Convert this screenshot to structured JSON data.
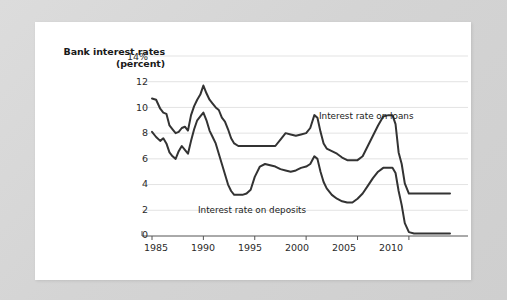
{
  "figure": {
    "background_color": "#d8d8d8",
    "card_color": "#ffffff"
  },
  "chart_data": {
    "type": "line",
    "title": "",
    "ylabel": "Bank interest rates (percent)",
    "xlabel": "",
    "ylim": [
      0,
      14
    ],
    "xlim": [
      1985,
      2014
    ],
    "grid": true,
    "legend_position": "inline-annotation",
    "y_ticks": [
      "0",
      "2",
      "4",
      "6",
      "8",
      "10",
      "12",
      "14%"
    ],
    "y_tick_values": [
      0,
      2,
      4,
      6,
      8,
      10,
      12,
      14
    ],
    "x_ticks": [
      "1985",
      "1990",
      "1995",
      "2000",
      "2005",
      "2010"
    ],
    "x_tick_values": [
      1985,
      1990,
      1995,
      2000,
      2005,
      2010
    ],
    "line_color": "#333333",
    "grid_color": "#e3e3e3",
    "axis_color": "#555555",
    "series": [
      {
        "name": "Interest rate on loans",
        "label_text": "Interest rate on loans",
        "color": "#333333",
        "x": [
          1985.0,
          1985.4,
          1985.8,
          1986.1,
          1986.4,
          1986.7,
          1987.0,
          1987.3,
          1987.6,
          1987.9,
          1988.2,
          1988.5,
          1988.8,
          1989.1,
          1989.4,
          1989.7,
          1990.0,
          1990.3,
          1990.6,
          1990.9,
          1991.2,
          1991.5,
          1991.8,
          1992.1,
          1992.4,
          1992.7,
          1993.0,
          1993.4,
          1993.8,
          1994.2,
          1994.6,
          1995.0,
          1995.5,
          1996.0,
          1996.5,
          1997.0,
          1997.5,
          1998.0,
          1998.5,
          1999.0,
          1999.5,
          2000.0,
          2000.4,
          2000.8,
          2001.1,
          2001.4,
          2001.7,
          2002.0,
          2002.5,
          2003.0,
          2003.5,
          2004.0,
          2004.5,
          2005.0,
          2005.5,
          2006.0,
          2006.5,
          2007.0,
          2007.5,
          2008.0,
          2008.4,
          2008.7,
          2009.0,
          2009.3,
          2009.6,
          2010.0,
          2010.5,
          2011.0,
          2012.0,
          2013.0,
          2014.0
        ],
        "y": [
          10.7,
          10.6,
          9.9,
          9.6,
          9.5,
          8.6,
          8.3,
          8.0,
          8.1,
          8.4,
          8.5,
          8.2,
          9.4,
          10.1,
          10.6,
          11.0,
          11.7,
          11.1,
          10.6,
          10.3,
          10.0,
          9.8,
          9.2,
          8.9,
          8.3,
          7.6,
          7.2,
          7.0,
          7.0,
          7.0,
          7.0,
          7.0,
          7.0,
          7.0,
          7.0,
          7.0,
          7.5,
          8.0,
          7.9,
          7.8,
          7.9,
          8.0,
          8.4,
          9.4,
          9.2,
          8.1,
          7.2,
          6.8,
          6.6,
          6.4,
          6.1,
          5.9,
          5.9,
          5.9,
          6.2,
          7.0,
          7.8,
          8.6,
          9.3,
          9.4,
          9.4,
          8.7,
          6.5,
          5.6,
          4.1,
          3.3,
          3.3,
          3.3,
          3.3,
          3.3,
          3.3
        ]
      },
      {
        "name": "Interest rate on deposits",
        "label_text": "Interest rate on deposits",
        "color": "#333333",
        "x": [
          1985.0,
          1985.4,
          1985.8,
          1986.1,
          1986.4,
          1986.7,
          1987.0,
          1987.3,
          1987.6,
          1987.9,
          1988.2,
          1988.5,
          1988.8,
          1989.1,
          1989.4,
          1989.7,
          1990.0,
          1990.3,
          1990.6,
          1990.9,
          1991.2,
          1991.5,
          1991.8,
          1992.1,
          1992.4,
          1992.7,
          1993.0,
          1993.4,
          1993.8,
          1994.2,
          1994.6,
          1995.0,
          1995.5,
          1996.0,
          1996.5,
          1997.0,
          1997.5,
          1998.0,
          1998.5,
          1999.0,
          1999.5,
          2000.0,
          2000.4,
          2000.8,
          2001.1,
          2001.4,
          2001.7,
          2002.0,
          2002.5,
          2003.0,
          2003.5,
          2004.0,
          2004.5,
          2005.0,
          2005.5,
          2006.0,
          2006.5,
          2007.0,
          2007.5,
          2008.0,
          2008.4,
          2008.7,
          2009.0,
          2009.3,
          2009.6,
          2010.0,
          2010.5,
          2011.0,
          2012.0,
          2013.0,
          2014.0
        ],
        "y": [
          8.1,
          7.7,
          7.4,
          7.6,
          7.2,
          6.5,
          6.2,
          6.0,
          6.6,
          7.0,
          6.7,
          6.4,
          7.4,
          8.3,
          9.0,
          9.3,
          9.6,
          9.0,
          8.2,
          7.7,
          7.2,
          6.4,
          5.6,
          4.8,
          4.0,
          3.5,
          3.2,
          3.2,
          3.2,
          3.3,
          3.6,
          4.6,
          5.4,
          5.6,
          5.5,
          5.4,
          5.2,
          5.1,
          5.0,
          5.1,
          5.3,
          5.4,
          5.6,
          6.2,
          6.0,
          5.0,
          4.2,
          3.7,
          3.2,
          2.9,
          2.7,
          2.6,
          2.6,
          2.9,
          3.3,
          3.9,
          4.5,
          5.0,
          5.3,
          5.3,
          5.3,
          4.9,
          3.5,
          2.4,
          1.0,
          0.3,
          0.2,
          0.2,
          0.2,
          0.2,
          0.2
        ]
      }
    ]
  }
}
